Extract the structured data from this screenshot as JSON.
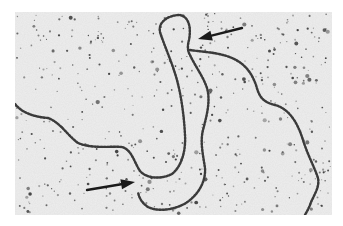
{
  "figure": {
    "type": "electron-micrograph",
    "background_color": "#eeeeee",
    "strand_color": "#3a3a3a",
    "particle_color": "#2e2e2e",
    "arrows": [
      {
        "name": "upper-right-arrow",
        "from": [
          242,
          28
        ],
        "to": [
          198,
          39
        ],
        "color": "#1a1a1a"
      },
      {
        "name": "lower-left-arrow",
        "from": [
          87,
          190
        ],
        "to": [
          135,
          182
        ],
        "color": "#1a1a1a"
      }
    ],
    "strand_paths": [
      {
        "name": "left-tail-and-loop",
        "d": "M15,104 C22,113 35,117 48,118 C60,122 68,136 78,143 C92,149 110,146 122,147 C132,150 134,162 140,171 C146,178 160,180 172,174 C182,166 186,150 185,135 C184,115 181,95 177,80 C172,62 164,45 160,32 C158,22 168,15 180,15 C190,17 191,30 189,40 C187,47 188,52 190,55 C195,66 203,76 207,88 C211,102 206,118 203,130 C200,142 203,155 205,168 C206,182 198,195 186,203 C174,210 158,212 148,207 C142,203 139,198 138,192"
      },
      {
        "name": "right-branch",
        "d": "M190,50 C202,52 218,52 232,58 C246,64 252,74 256,85 C259,96 262,102 275,105 C290,109 298,124 303,140 C308,156 314,166 318,178 C320,188 313,196 310,205 C308,210 306,213 305,215"
      }
    ]
  }
}
